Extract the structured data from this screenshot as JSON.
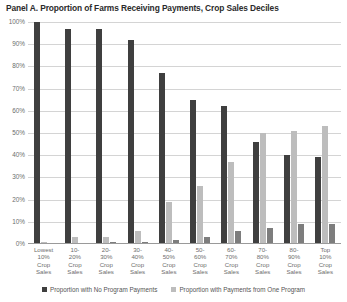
{
  "chart_data": {
    "type": "bar",
    "title": "Panel A. Proportion of Farms Receiving Payments, Crop Sales Deciles",
    "xlabel": "",
    "ylabel": "",
    "ylim": [
      0,
      100
    ],
    "ytick_labels": [
      "100%",
      "90%",
      "80%",
      "70%",
      "60%",
      "50%",
      "40%",
      "30%",
      "20%",
      "10%",
      "0%"
    ],
    "ytick_values": [
      100,
      90,
      80,
      70,
      60,
      50,
      40,
      30,
      20,
      10,
      0
    ],
    "grid": true,
    "legend_position": "bottom",
    "categories": [
      "Lowest 10% Crop Sales",
      "10-20% Crop Sales",
      "20-30% Crop Sales",
      "30-40% Crop Sales",
      "40-50% Crop Sales",
      "50-60% Crop Sales",
      "60-70% Crop Sales",
      "70-80% Crop Sales",
      "80-90% Crop Sales",
      "Top 10% Crop Sales"
    ],
    "category_lines": [
      [
        "Lowest",
        "10%",
        "Crop",
        "Sales"
      ],
      [
        "10-",
        "20%",
        "Crop",
        "Sales"
      ],
      [
        "20-",
        "30%",
        "Crop",
        "Sales"
      ],
      [
        "30-",
        "40%",
        "Crop",
        "Sales"
      ],
      [
        "40-",
        "50%",
        "Crop",
        "Sales"
      ],
      [
        "50-",
        "60%",
        "Crop",
        "Sales"
      ],
      [
        "60-",
        "70%",
        "Crop",
        "Sales"
      ],
      [
        "70-",
        "80%",
        "Crop",
        "Sales"
      ],
      [
        "80-",
        "90%",
        "Crop",
        "Sales"
      ],
      [
        "Top",
        "10%",
        "Crop",
        "Sales"
      ]
    ],
    "series": [
      {
        "name": "Proportion with No Program Payments",
        "color": "#3f3f3f",
        "values": [
          100,
          97,
          97,
          92,
          77,
          65,
          62,
          46,
          40,
          39
        ]
      },
      {
        "name": "Proportion with Payments from One Program",
        "color": "#bdbdbd",
        "values": [
          1,
          3,
          3,
          6,
          19,
          26,
          37,
          50,
          51,
          53
        ]
      },
      {
        "name": "",
        "color": "#7d7d7d",
        "values": [
          0,
          0,
          1,
          1,
          2,
          3,
          6,
          7,
          9,
          9
        ]
      }
    ]
  },
  "legend": {
    "items": [
      {
        "label": "Proportion with No Program Payments"
      },
      {
        "label": "Proportion with Payments from One Program"
      }
    ]
  }
}
